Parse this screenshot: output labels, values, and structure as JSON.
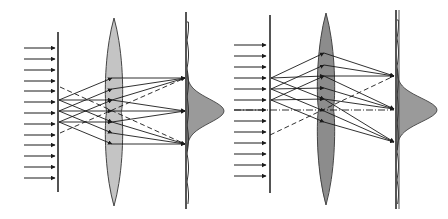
{
  "diagram": {
    "type": "optics-ray-diagram",
    "colors": {
      "line": "#1a1a1a",
      "lens_left": "#c4c4c4",
      "lens_right": "#8c8c8c",
      "profile_fill": "#9a9a9a",
      "background": "#ffffff"
    },
    "panels": [
      {
        "id": "left",
        "incident_arrows_y": [
          48,
          59,
          70,
          81,
          91,
          102,
          113,
          124,
          135,
          145,
          156,
          167,
          178
        ],
        "arrow_x": [
          24,
          55
        ],
        "grating": {
          "x": 58,
          "top": 32,
          "bottom": 192,
          "slits_y": [
            100,
            111,
            122
          ]
        },
        "lens": {
          "cx": 114,
          "top": 18,
          "bottom": 206,
          "half_width": 7,
          "fill_key": "lens_left"
        },
        "lens_points_y": [
          78,
          89,
          100,
          111,
          122,
          133,
          144
        ],
        "focal_points": [
          [
            185,
            78
          ],
          [
            185,
            111
          ],
          [
            185,
            144
          ]
        ],
        "screen": {
          "x": 186,
          "top": 12,
          "bottom": 209,
          "double": false
        },
        "profile": {
          "peak_y": 111,
          "peak_x": 223,
          "sigma": 12
        },
        "dashed_rays": [
          [
            [
              60,
              87
            ],
            [
              185,
              144
            ]
          ],
          [
            [
              60,
              133
            ],
            [
              185,
              78
            ]
          ]
        ]
      },
      {
        "id": "right",
        "incident_arrows_y": [
          45,
          56,
          67,
          78,
          89,
          100,
          110,
          121,
          132,
          143,
          154,
          165,
          176
        ],
        "arrow_x": [
          234,
          266
        ],
        "grating": {
          "x": 270,
          "top": 15,
          "bottom": 193,
          "slits_y": [
            78,
            89,
            100
          ]
        },
        "lens": {
          "cx": 326,
          "top": 13,
          "bottom": 205,
          "half_width": 7,
          "fill_key": "lens_right"
        },
        "lens_points_y": [
          53,
          65,
          76,
          88,
          99,
          111,
          122
        ],
        "focal_points": [
          [
            394,
            76
          ],
          [
            394,
            109
          ],
          [
            394,
            142
          ]
        ],
        "screen": {
          "x": 396,
          "top": 10,
          "bottom": 209,
          "double": true
        },
        "profile": {
          "peak_y": 110,
          "peak_x": 436,
          "sigma": 12
        },
        "dashed_rays": [
          [
            [
              270,
              135
            ],
            [
              394,
              76
            ]
          ]
        ],
        "dashdot_axis": [
          [
            234,
            110
          ],
          [
            394,
            110
          ]
        ]
      }
    ]
  }
}
